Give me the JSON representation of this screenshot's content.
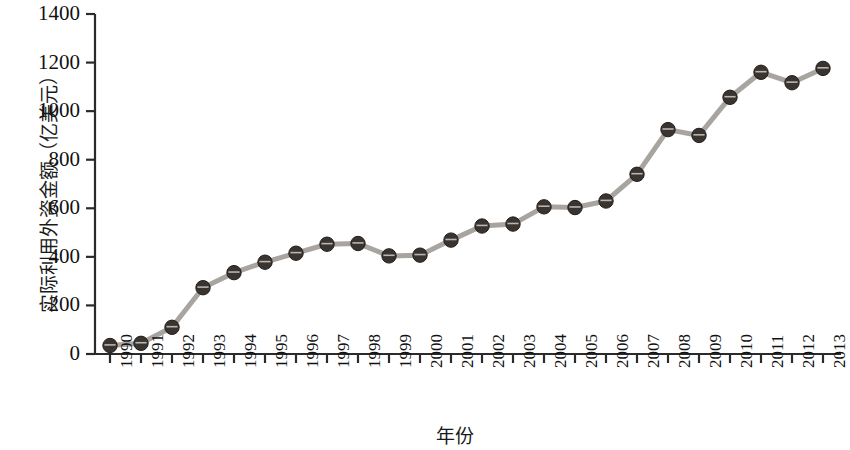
{
  "chart_data": {
    "type": "line",
    "title": "",
    "xlabel": "年份",
    "ylabel": "实际利用外资金额（亿美元）",
    "categories": [
      "1990",
      "1991",
      "1992",
      "1993",
      "1994",
      "1995",
      "1996",
      "1997",
      "1998",
      "1999",
      "2000",
      "2001",
      "2002",
      "2003",
      "2004",
      "2005",
      "2006",
      "2007",
      "2008",
      "2009",
      "2010",
      "2011",
      "2012",
      "2013"
    ],
    "values": [
      35,
      44,
      110,
      273,
      335,
      378,
      415,
      452,
      455,
      404,
      407,
      469,
      527,
      535,
      606,
      603,
      630,
      740,
      924,
      900,
      1057,
      1160,
      1117,
      1176
    ],
    "series": [
      {
        "name": "实际利用外资金额",
        "values": [
          35,
          44,
          110,
          273,
          335,
          378,
          415,
          452,
          455,
          404,
          407,
          469,
          527,
          535,
          606,
          603,
          630,
          740,
          924,
          900,
          1057,
          1160,
          1117,
          1176
        ]
      }
    ],
    "ylim": [
      0,
      1400
    ],
    "yticks": [
      0,
      200,
      400,
      600,
      800,
      1000,
      1200,
      1400
    ],
    "ytick_labels": [
      "0",
      "200",
      "400",
      "600",
      "800",
      "1000",
      "1200",
      "1400"
    ],
    "grid": false,
    "legend": false,
    "legend_position": "none",
    "marker": "circle",
    "line_color": "#a8a5a0",
    "marker_color": "#3a3430"
  }
}
